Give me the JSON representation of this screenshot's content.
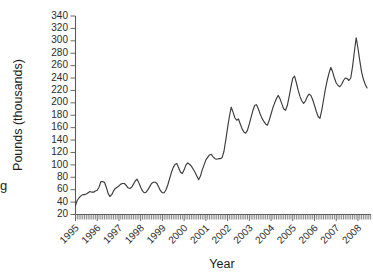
{
  "chart_data": {
    "type": "line",
    "title": "",
    "xlabel": "Year",
    "ylabel": "Pounds (thousands)",
    "xlim": [
      1995.0,
      2008.6
    ],
    "ylim": [
      20,
      340
    ],
    "ytick_step": 20,
    "yticks": [
      20,
      40,
      60,
      80,
      100,
      120,
      140,
      160,
      180,
      200,
      220,
      240,
      260,
      280,
      300,
      320,
      340
    ],
    "xticks": [
      1995,
      1996,
      1997,
      1998,
      1999,
      2000,
      2001,
      2002,
      2003,
      2004,
      2005,
      2006,
      2007,
      2008
    ],
    "xtick_labels": [
      "1995",
      "1996",
      "1997",
      "1998",
      "1999",
      "2000",
      "2001",
      "2002",
      "2003",
      "2004",
      "2005",
      "2006",
      "2007",
      "2008"
    ],
    "minor_xticks_per_year": 12,
    "grid": false,
    "legend": null,
    "series": [
      {
        "name": "Pounds (thousands)",
        "x": [
          1995.0,
          1995.083,
          1995.167,
          1995.25,
          1995.333,
          1995.417,
          1995.5,
          1995.583,
          1995.667,
          1995.75,
          1995.833,
          1995.917,
          1996.0,
          1996.083,
          1996.167,
          1996.25,
          1996.333,
          1996.417,
          1996.5,
          1996.583,
          1996.667,
          1996.75,
          1996.833,
          1996.917,
          1997.0,
          1997.083,
          1997.167,
          1997.25,
          1997.333,
          1997.417,
          1997.5,
          1997.583,
          1997.667,
          1997.75,
          1997.833,
          1997.917,
          1998.0,
          1998.083,
          1998.167,
          1998.25,
          1998.333,
          1998.417,
          1998.5,
          1998.583,
          1998.667,
          1998.75,
          1998.833,
          1998.917,
          1999.0,
          1999.083,
          1999.167,
          1999.25,
          1999.333,
          1999.417,
          1999.5,
          1999.583,
          1999.667,
          1999.75,
          1999.833,
          1999.917,
          2000.0,
          2000.083,
          2000.167,
          2000.25,
          2000.333,
          2000.417,
          2000.5,
          2000.583,
          2000.667,
          2000.75,
          2000.833,
          2000.917,
          2001.0,
          2001.083,
          2001.167,
          2001.25,
          2001.333,
          2001.417,
          2001.5,
          2001.583,
          2001.667,
          2001.75,
          2001.833,
          2001.917,
          2002.0,
          2002.083,
          2002.167,
          2002.25,
          2002.333,
          2002.417,
          2002.5,
          2002.583,
          2002.667,
          2002.75,
          2002.833,
          2002.917,
          2003.0,
          2003.083,
          2003.167,
          2003.25,
          2003.333,
          2003.417,
          2003.5,
          2003.583,
          2003.667,
          2003.75,
          2003.833,
          2003.917,
          2004.0,
          2004.083,
          2004.167,
          2004.25,
          2004.333,
          2004.417,
          2004.5,
          2004.583,
          2004.667,
          2004.75,
          2004.833,
          2004.917,
          2005.0,
          2005.083,
          2005.167,
          2005.25,
          2005.333,
          2005.417,
          2005.5,
          2005.583,
          2005.667,
          2005.75,
          2005.833,
          2005.917,
          2006.0,
          2006.083,
          2006.167,
          2006.25,
          2006.333,
          2006.417,
          2006.5,
          2006.583,
          2006.667,
          2006.75,
          2006.833,
          2006.917,
          2007.0,
          2007.083,
          2007.167,
          2007.25,
          2007.333,
          2007.417,
          2007.5,
          2007.583,
          2007.667,
          2007.75,
          2007.833,
          2007.917,
          2008.0,
          2008.083,
          2008.167,
          2008.25,
          2008.333,
          2008.417
        ],
        "values": [
          35,
          43,
          47,
          50,
          52,
          52,
          53,
          55,
          57,
          56,
          56,
          58,
          59,
          64,
          73,
          73,
          72,
          64,
          54,
          49,
          52,
          58,
          62,
          64,
          66,
          69,
          70,
          70,
          67,
          63,
          62,
          64,
          69,
          74,
          77,
          71,
          64,
          58,
          55,
          56,
          60,
          65,
          70,
          72,
          72,
          70,
          64,
          58,
          55,
          55,
          60,
          68,
          78,
          88,
          96,
          101,
          102,
          95,
          88,
          86,
          92,
          100,
          103,
          101,
          98,
          93,
          88,
          82,
          76,
          82,
          92,
          100,
          108,
          112,
          116,
          117,
          113,
          110,
          109,
          110,
          110,
          112,
          122,
          140,
          160,
          178,
          193,
          185,
          176,
          172,
          174,
          166,
          158,
          153,
          151,
          156,
          166,
          177,
          188,
          196,
          197,
          190,
          182,
          175,
          170,
          166,
          164,
          172,
          182,
          192,
          200,
          207,
          212,
          206,
          198,
          190,
          188,
          196,
          210,
          226,
          240,
          243,
          232,
          220,
          210,
          203,
          199,
          203,
          210,
          214,
          212,
          205,
          196,
          186,
          178,
          175,
          188,
          205,
          222,
          236,
          248,
          257,
          250,
          240,
          232,
          228,
          226,
          230,
          236,
          240,
          239,
          236,
          240,
          258,
          282,
          305,
          288,
          268,
          250,
          238,
          230,
          224
        ]
      }
    ]
  },
  "labels": {
    "ylabel": "Pounds (thousands)",
    "xlabel": "Year",
    "edge_fragment": "g"
  }
}
